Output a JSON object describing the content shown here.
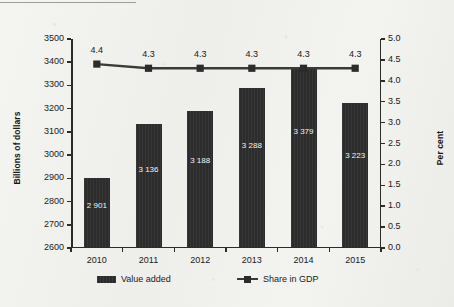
{
  "chart_data": {
    "type": "bar",
    "title": "",
    "xlabel": "",
    "ylabel": "Billions of dollars",
    "y2label": "Per cent",
    "categories": [
      "2010",
      "2011",
      "2012",
      "2013",
      "2014",
      "2015"
    ],
    "series": [
      {
        "name": "Value added",
        "type": "bar",
        "axis": "left",
        "values": [
          2901,
          3136,
          3188,
          3288,
          3379,
          3223
        ],
        "value_labels": [
          "2 901",
          "3 136",
          "3 188",
          "3 288",
          "3 379",
          "3 223"
        ]
      },
      {
        "name": "Share in GDP",
        "type": "line",
        "axis": "right",
        "values": [
          4.4,
          4.3,
          4.3,
          4.3,
          4.3,
          4.3
        ],
        "value_labels": [
          "4.4",
          "4.3",
          "4.3",
          "4.3",
          "4.3",
          "4.3"
        ]
      }
    ],
    "ylim": [
      2600,
      3500
    ],
    "yticks": [
      2600,
      2700,
      2800,
      2900,
      3000,
      3100,
      3200,
      3300,
      3400,
      3500
    ],
    "ytick_labels": [
      "2600",
      "2700",
      "2800",
      "2900",
      "3000",
      "3100",
      "3200",
      "3300",
      "3400",
      "3500"
    ],
    "y2lim": [
      0.0,
      5.0
    ],
    "y2ticks": [
      0.0,
      0.5,
      1.0,
      1.5,
      2.0,
      2.5,
      3.0,
      3.5,
      4.0,
      4.5,
      5.0
    ],
    "y2tick_labels": [
      "0.0",
      "0.5",
      "1.0",
      "1.5",
      "2.0",
      "2.5",
      "3.0",
      "3.5",
      "4.0",
      "4.5",
      "5.0"
    ],
    "grid": false,
    "legend_position": "bottom",
    "legend": [
      "Value added",
      "Share in GDP"
    ],
    "colors": {
      "bar": "#2c2c2c",
      "line": "#3a3a3a",
      "axis": "#2b2b2b",
      "bar_label_text": "#f4f4f4",
      "background": "#f2f2ef"
    }
  }
}
